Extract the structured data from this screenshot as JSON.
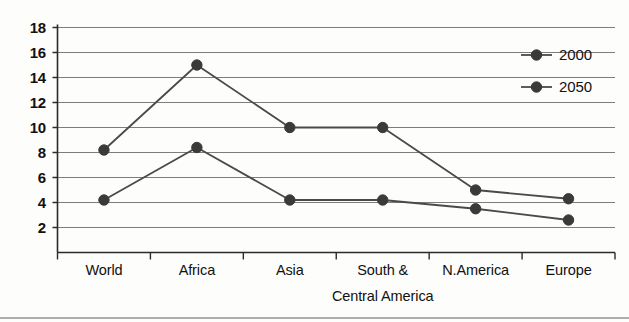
{
  "chart_data": {
    "type": "line",
    "title": "",
    "subtitle": "",
    "xlabel": "",
    "ylabel": "",
    "categories": [
      "World",
      "Africa",
      "Asia",
      "South &\nCentral America",
      "N.America",
      "Europe"
    ],
    "category_labels": [
      {
        "line1": "World",
        "line2": ""
      },
      {
        "line1": "Africa",
        "line2": ""
      },
      {
        "line1": "Asia",
        "line2": ""
      },
      {
        "line1": "South &",
        "line2": "Central America"
      },
      {
        "line1": "N.America",
        "line2": ""
      },
      {
        "line1": "Europe",
        "line2": ""
      }
    ],
    "series": [
      {
        "name": "2000",
        "values": [
          8.2,
          15.0,
          10.0,
          10.0,
          5.0,
          4.3
        ],
        "color": "#444444",
        "marker": "circle"
      },
      {
        "name": "2050",
        "values": [
          4.2,
          8.4,
          4.2,
          4.2,
          3.5,
          2.6
        ],
        "color": "#444444",
        "marker": "circle"
      }
    ],
    "yticks": [
      2,
      4,
      6,
      8,
      10,
      12,
      14,
      16,
      18
    ],
    "ylim": [
      0,
      18
    ],
    "xlim": [
      0,
      6
    ],
    "grid": true,
    "grid_axis": "y",
    "legend": [
      "2000",
      "2050"
    ],
    "legend_position": "top-right-inside"
  },
  "colors": {
    "line": "#4a4a4a",
    "marker": "#3a3a3a",
    "grid": "#7d7d7d",
    "axis": "#2b2b2b",
    "text": "#111111",
    "background": "#fdfdfc",
    "rule": "#aeaeae"
  }
}
